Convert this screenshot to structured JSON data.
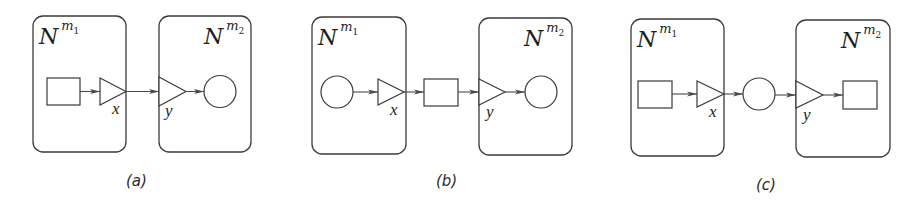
{
  "figure": {
    "panels": [
      {
        "id": "a",
        "caption": "(a)",
        "left_net": {
          "base": "N",
          "sup": "m",
          "sub": "1",
          "port_label": "x"
        },
        "right_net": {
          "base": "N",
          "sup": "m",
          "sub": "2",
          "port_label": "y"
        },
        "flow": [
          "square",
          "port-x",
          "port-y",
          "circle"
        ]
      },
      {
        "id": "b",
        "caption": "(b)",
        "left_net": {
          "base": "N",
          "sup": "m",
          "sub": "1",
          "port_label": "x"
        },
        "right_net": {
          "base": "N",
          "sup": "m",
          "sub": "2",
          "port_label": "y"
        },
        "flow": [
          "circle",
          "port-x",
          "square",
          "port-y",
          "circle"
        ]
      },
      {
        "id": "c",
        "caption": "(c)",
        "left_net": {
          "base": "N",
          "sup": "m",
          "sub": "1",
          "port_label": "x"
        },
        "right_net": {
          "base": "N",
          "sup": "m",
          "sub": "2",
          "port_label": "y"
        },
        "flow": [
          "square",
          "port-x",
          "circle",
          "port-y",
          "square"
        ]
      }
    ],
    "colors": {
      "stroke": "#3a3a3a",
      "text": "#1e1e1e",
      "background": "#ffffff"
    }
  }
}
